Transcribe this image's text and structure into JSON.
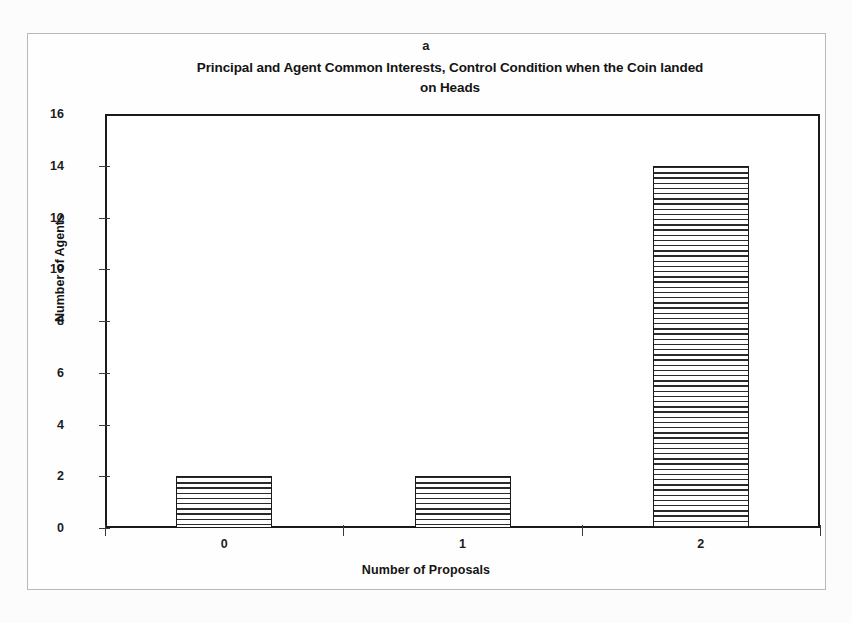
{
  "figure": {
    "panel_letter": "a",
    "background_color": "#fcfcfc",
    "border_color": "#b9b9b9"
  },
  "chart_data": {
    "type": "bar",
    "title": "Principal and Agent Common Interests, Control Condition when the Coin landed on Heads",
    "title_line1": "Principal and Agent Common Interests, Control Condition when the Coin landed",
    "title_line2": "on Heads",
    "panel_label": "a",
    "categories": [
      "0",
      "1",
      "2"
    ],
    "values": [
      2,
      2,
      14
    ],
    "xlabel": "Number of Proposals",
    "ylabel": "Number of Agents",
    "ylim": [
      0,
      16
    ],
    "ytick_values": [
      "16",
      "14",
      "12",
      "10",
      "8",
      "6",
      "4",
      "2",
      "0"
    ],
    "ytick_numbers": [
      16,
      14,
      12,
      10,
      8,
      6,
      4,
      2,
      0
    ],
    "ytick_step": 2,
    "grid": false,
    "legend": null,
    "bar_fill": "horizontal-hatch",
    "bar_edge_color": "#1a1a1a",
    "bar_fill_color": "#2b2b2b",
    "plot_background": "#ffffff"
  }
}
